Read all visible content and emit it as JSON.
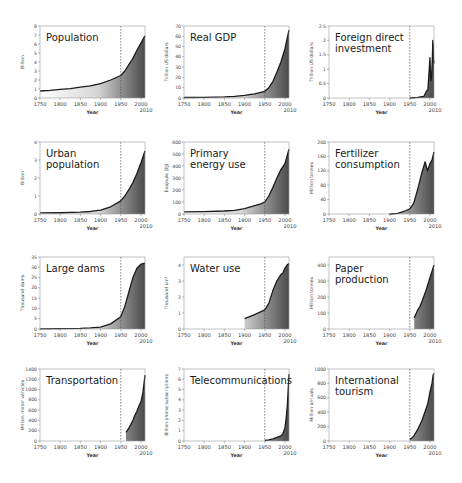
{
  "figure": {
    "xlabel": "Year",
    "xticks": [
      1750,
      1800,
      1850,
      1900,
      1950,
      2000
    ],
    "xtick_extra": 2010,
    "xlim": [
      1750,
      2010
    ],
    "reference_year": 1950
  },
  "chart_data": [
    {
      "type": "area",
      "title": "Population",
      "xlabel": "Year",
      "ylabel": "Billion",
      "ylim": [
        0,
        8
      ],
      "yticks": [
        0,
        1,
        2,
        3,
        4,
        5,
        6,
        7,
        8
      ],
      "x": [
        1750,
        1775,
        1800,
        1825,
        1850,
        1875,
        1900,
        1925,
        1950,
        1960,
        1970,
        1980,
        1990,
        2000,
        2010
      ],
      "values": [
        0.78,
        0.85,
        0.95,
        1.05,
        1.2,
        1.35,
        1.6,
        2.0,
        2.5,
        3.0,
        3.7,
        4.4,
        5.3,
        6.1,
        6.9
      ],
      "annotation": "dashed vertical line at 1950"
    },
    {
      "type": "area",
      "title": "Real GDP",
      "xlabel": "Year",
      "ylabel": "Trillion US dollars",
      "ylim": [
        0,
        70
      ],
      "yticks": [
        0,
        10,
        20,
        30,
        40,
        50,
        60,
        70
      ],
      "x": [
        1750,
        1800,
        1850,
        1875,
        1900,
        1925,
        1950,
        1960,
        1970,
        1980,
        1990,
        2000,
        2005,
        2010
      ],
      "values": [
        0.5,
        0.7,
        1.0,
        1.5,
        2.5,
        4,
        6.5,
        10,
        16,
        25,
        35,
        48,
        57,
        66
      ]
    },
    {
      "type": "area",
      "title": "Foreign direct investment",
      "xlabel": "Year",
      "ylabel": "Trillion US dollars",
      "ylim": [
        0,
        2.5
      ],
      "yticks": [
        0,
        0.5,
        1,
        1.5,
        2,
        2.5
      ],
      "x": [
        1950,
        1970,
        1980,
        1985,
        1990,
        1995,
        2000,
        2002,
        2004,
        2006,
        2007,
        2008,
        2009,
        2010
      ],
      "values": [
        0.0,
        0.02,
        0.05,
        0.06,
        0.2,
        0.3,
        1.4,
        0.6,
        0.7,
        1.4,
        2.0,
        1.8,
        1.2,
        1.3
      ]
    },
    {
      "type": "area",
      "title": "Urban population",
      "xlabel": "Year",
      "ylabel": "Billion",
      "ylim": [
        0,
        4
      ],
      "yticks": [
        0,
        1,
        2,
        3,
        4
      ],
      "x": [
        1750,
        1800,
        1850,
        1875,
        1900,
        1925,
        1950,
        1960,
        1970,
        1980,
        1990,
        2000,
        2010
      ],
      "values": [
        0.06,
        0.07,
        0.1,
        0.14,
        0.22,
        0.4,
        0.73,
        1.0,
        1.35,
        1.75,
        2.25,
        2.85,
        3.5
      ]
    },
    {
      "type": "area",
      "title": "Primary energy use",
      "xlabel": "Year",
      "ylabel": "Exajoule (EJ)",
      "ylim": [
        0,
        600
      ],
      "yticks": [
        0,
        100,
        200,
        300,
        400,
        500,
        600
      ],
      "x": [
        1750,
        1800,
        1850,
        1875,
        1900,
        1925,
        1940,
        1950,
        1960,
        1970,
        1980,
        1990,
        2000,
        2010
      ],
      "values": [
        18,
        20,
        25,
        30,
        45,
        70,
        85,
        100,
        150,
        220,
        300,
        370,
        420,
        540
      ]
    },
    {
      "type": "area",
      "title": "Fertilizer consumption",
      "xlabel": "Year",
      "ylabel": "Million tonnes",
      "ylim": [
        0,
        200
      ],
      "yticks": [
        0,
        40,
        80,
        120,
        160,
        200
      ],
      "x": [
        1900,
        1920,
        1930,
        1940,
        1950,
        1960,
        1970,
        1980,
        1988,
        1994,
        2000,
        2005,
        2010
      ],
      "values": [
        0,
        2,
        5,
        9,
        14,
        30,
        70,
        115,
        145,
        120,
        140,
        150,
        172
      ]
    },
    {
      "type": "area",
      "title": "Large dams",
      "xlabel": "Year",
      "ylabel": "Thousand dams",
      "ylim": [
        0,
        35
      ],
      "yticks": [
        0,
        5,
        10,
        15,
        20,
        25,
        30,
        35
      ],
      "x": [
        1750,
        1800,
        1850,
        1875,
        1900,
        1925,
        1950,
        1960,
        1970,
        1980,
        1990,
        2000,
        2010
      ],
      "values": [
        0.1,
        0.2,
        0.3,
        0.5,
        0.9,
        2.5,
        6.0,
        11,
        18,
        25,
        29.5,
        31.5,
        32
      ]
    },
    {
      "type": "area",
      "title": "Water use",
      "xlabel": "Year",
      "ylabel": "Thousand km³",
      "ylim": [
        0,
        4.5
      ],
      "yticks": [
        0,
        1,
        2,
        3,
        4
      ],
      "x": [
        1900,
        1925,
        1950,
        1960,
        1970,
        1980,
        1985,
        1990,
        1995,
        2000,
        2005,
        2010
      ],
      "values": [
        0.65,
        0.9,
        1.2,
        1.6,
        2.4,
        3.0,
        3.2,
        3.4,
        3.5,
        3.8,
        4.0,
        4.1
      ]
    },
    {
      "type": "area",
      "title": "Paper production",
      "xlabel": "Year",
      "ylabel": "Million tonnes",
      "ylim": [
        0,
        450
      ],
      "yticks": [
        0,
        100,
        200,
        300,
        400
      ],
      "x": [
        1961,
        1970,
        1975,
        1980,
        1990,
        2000,
        2005,
        2010
      ],
      "values": [
        70,
        120,
        140,
        170,
        240,
        320,
        360,
        400
      ]
    },
    {
      "type": "area",
      "title": "Transportation",
      "xlabel": "Year",
      "ylabel": "Million motor vehicles",
      "ylim": [
        0,
        1400
      ],
      "yticks": [
        0,
        200,
        400,
        600,
        800,
        1000,
        1200,
        1400
      ],
      "x": [
        1963,
        1970,
        1980,
        1985,
        1990,
        1995,
        2000,
        2005,
        2010
      ],
      "values": [
        170,
        250,
        400,
        500,
        580,
        680,
        760,
        950,
        1280
      ]
    },
    {
      "type": "area",
      "title": "Telecommunications",
      "xlabel": "Year",
      "ylabel": "Billion phone subscriptions",
      "ylim": [
        0,
        7
      ],
      "yticks": [
        0,
        1,
        2,
        3,
        4,
        5,
        6,
        7
      ],
      "x": [
        1950,
        1960,
        1970,
        1980,
        1990,
        1995,
        2000,
        2003,
        2006,
        2008,
        2010
      ],
      "values": [
        0.05,
        0.1,
        0.2,
        0.35,
        0.5,
        0.7,
        1.3,
        2.2,
        3.5,
        5.0,
        6.5
      ]
    },
    {
      "type": "area",
      "title": "International tourism",
      "xlabel": "Year",
      "ylabel": "Million arrivals",
      "ylim": [
        0,
        1000
      ],
      "yticks": [
        0,
        200,
        400,
        600,
        800,
        1000
      ],
      "x": [
        1950,
        1955,
        1960,
        1970,
        1980,
        1990,
        1995,
        2000,
        2005,
        2008,
        2010
      ],
      "values": [
        25,
        40,
        70,
        165,
        280,
        440,
        530,
        680,
        800,
        920,
        940
      ]
    }
  ]
}
